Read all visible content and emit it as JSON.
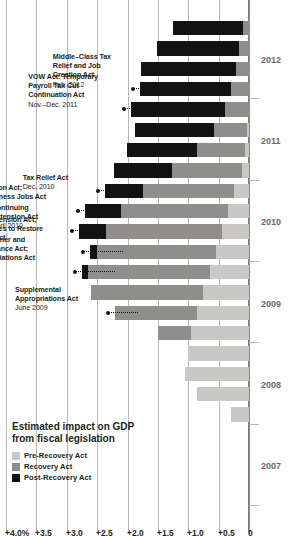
{
  "chart_data": {
    "type": "bar",
    "title": "Estimated impact on GDP\nfrom fiscal legislation",
    "xlabel": "",
    "ylabel": "",
    "ylim": [
      0,
      4.0
    ],
    "grid": true,
    "legend_position": "left",
    "stacked": true,
    "orientation": "rotated-90",
    "ytick_labels": [
      "+4.0%",
      "+3.5",
      "+3.0",
      "+2.5",
      "+2.0",
      "+1.5",
      "+1.0",
      "+0.5",
      "0"
    ],
    "ytick_values": [
      4.0,
      3.5,
      3.0,
      2.5,
      2.0,
      1.5,
      1.0,
      0.5,
      0
    ],
    "xtick_labels": [
      "2007",
      "2008",
      "2009",
      "2010",
      "2011",
      "2012"
    ],
    "categories": [
      "2007Q1",
      "2007Q2",
      "2007Q3",
      "2007Q4",
      "2008Q1",
      "2008Q2",
      "2008Q3",
      "2008Q4",
      "2009Q1",
      "2009Q2",
      "2009Q3",
      "2009Q4",
      "2010Q1",
      "2010Q2",
      "2010Q3",
      "2010Q4",
      "2011Q1",
      "2011Q2",
      "2011Q3",
      "2011Q4",
      "2012Q1",
      "2012Q2",
      "2012Q3",
      "2012Q4"
    ],
    "series": [
      {
        "name": "Pre-Recovery Act",
        "color": "#c9c8c4",
        "values": [
          0,
          0,
          0,
          0,
          0.3,
          0.85,
          1.05,
          1.0,
          0.95,
          0.85,
          0.75,
          0.65,
          0.55,
          0.45,
          0.35,
          0.25,
          0.12,
          0.06,
          0.03,
          0.0,
          0,
          0,
          0,
          0
        ]
      },
      {
        "name": "Recovery Act",
        "color": "#8f8e8a",
        "values": [
          0,
          0,
          0,
          0,
          0,
          0,
          0,
          0,
          0.55,
          1.35,
          1.85,
          2.0,
          1.95,
          1.9,
          1.75,
          1.5,
          1.15,
          0.8,
          0.55,
          0.4,
          0.3,
          0.22,
          0.16,
          0.1
        ]
      },
      {
        "name": "Post-Recovery Act",
        "color": "#121212",
        "values": [
          0,
          0,
          0,
          0,
          0,
          0,
          0,
          0,
          0,
          0,
          0,
          0.1,
          0.12,
          0.45,
          0.6,
          0.62,
          0.95,
          1.15,
          1.3,
          1.55,
          1.5,
          1.55,
          1.35,
          1.15
        ]
      }
    ],
    "annotations": [
      {
        "id": "supplemental-appropriations-act",
        "label": "Supplemental\nAppropriations Act",
        "date": "June 2009",
        "target_category": "2009Q2"
      },
      {
        "id": "worker-homeowner-business-assistance-act",
        "label": "Worker, Homeowner and\nBusiness Assistance Act;\nDefense Appropriations Act",
        "date": "Nov.–Dec. 2009",
        "target_category": "2009Q4"
      },
      {
        "id": "temporary-extension-act",
        "label": "Temporary Extension Act;\nHiring Incentives to Restore\nEmployment Act",
        "date": "March 2010",
        "target_category": "2010Q1"
      },
      {
        "id": "continuing-extension-act",
        "label": "Continuing\nExtension Act",
        "date": "April 2010",
        "target_category": "2010Q2"
      },
      {
        "id": "unemployment-compensation-extension-act",
        "label": "Unemployment Compensation Extension Act;\nFAA Air Transportation Act; Small Business Jobs Act",
        "date": "July–Sept. 2010",
        "target_category": "2010Q3"
      },
      {
        "id": "tax-relief-act",
        "label": "Tax Relief Act",
        "date": "Dec. 2010",
        "target_category": "2010Q4"
      },
      {
        "id": "vow-act",
        "label": "VOW Act: Temporary\nPayroll Tax Cut\nContinuation Act",
        "date": "Nov.–Dec. 2011",
        "target_category": "2011Q4"
      },
      {
        "id": "middle-class-tax-relief-and-job-creation-act",
        "label": "Middle–Class Tax\nRelief and Job\nCreation Act",
        "date": "Feb. 2012",
        "target_category": "2012Q1"
      }
    ]
  }
}
